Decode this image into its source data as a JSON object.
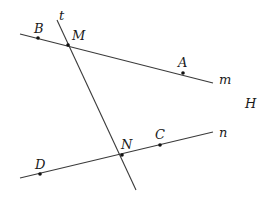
{
  "diagram": {
    "lines": [
      {
        "name": "m",
        "x1": 20,
        "y1": 34,
        "x2": 213,
        "y2": 83
      },
      {
        "name": "t",
        "x1": 57,
        "y1": 20,
        "x2": 136,
        "y2": 190
      },
      {
        "name": "n",
        "x1": 20,
        "y1": 178,
        "x2": 213,
        "y2": 132
      }
    ],
    "points": [
      {
        "name": "B",
        "x": 38,
        "y": 38
      },
      {
        "name": "M",
        "x": 68,
        "y": 45
      },
      {
        "name": "A",
        "x": 183,
        "y": 73
      },
      {
        "name": "N",
        "x": 122,
        "y": 155
      },
      {
        "name": "C",
        "x": 160,
        "y": 145
      },
      {
        "name": "D",
        "x": 40,
        "y": 174
      }
    ],
    "labels": {
      "t": "t",
      "B": "B",
      "M": "M",
      "A": "A",
      "m": "m",
      "H": "H",
      "n": "n",
      "C": "C",
      "N": "N",
      "D": "D"
    }
  }
}
